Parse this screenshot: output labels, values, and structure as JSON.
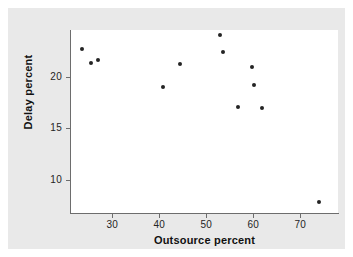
{
  "figure": {
    "background_color": "#e9e9e9",
    "plot_background_color": "#ffffff",
    "axis_color": "#6d6d6d",
    "marker_color": "#242424"
  },
  "chart_data": {
    "type": "scatter",
    "title": "",
    "xlabel": "Outsource percent",
    "ylabel": "Delay percent",
    "xlim": [
      21,
      78
    ],
    "ylim": [
      6.8,
      24.5
    ],
    "xticks": [
      30,
      40,
      50,
      60,
      70
    ],
    "yticks": [
      20,
      15,
      10
    ],
    "xtick_labels": [
      "30",
      "40",
      "50",
      "60",
      "70"
    ],
    "ytick_labels": [
      "20",
      "15",
      "10"
    ],
    "grid": false,
    "legend": null,
    "points": [
      {
        "x": 23.5,
        "y": 22.7
      },
      {
        "x": 25.5,
        "y": 21.3
      },
      {
        "x": 27.0,
        "y": 21.6
      },
      {
        "x": 40.7,
        "y": 19.0
      },
      {
        "x": 44.3,
        "y": 21.2
      },
      {
        "x": 52.8,
        "y": 24.0
      },
      {
        "x": 53.6,
        "y": 22.4
      },
      {
        "x": 56.7,
        "y": 17.1
      },
      {
        "x": 59.8,
        "y": 20.9
      },
      {
        "x": 60.1,
        "y": 19.2
      },
      {
        "x": 61.8,
        "y": 17.0
      },
      {
        "x": 74.0,
        "y": 7.9
      }
    ]
  }
}
